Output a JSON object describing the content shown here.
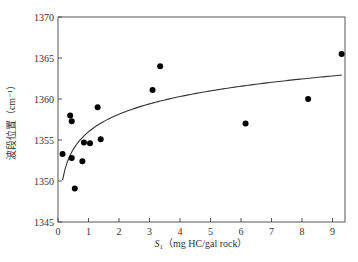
{
  "chart_data": {
    "type": "scatter",
    "title": "",
    "xlabel": "S1（mg HC/gal rock）",
    "xlabel_main": "S",
    "xlabel_sub": "1",
    "xlabel_rest": "（mg HC/gal rock）",
    "ylabel": "波段位置（cm⁻¹）",
    "xlim": [
      0,
      9.4
    ],
    "ylim": [
      1345,
      1370
    ],
    "xticks": [
      0,
      1,
      2,
      3,
      4,
      5,
      6,
      7,
      8,
      9
    ],
    "yticks": [
      1345,
      1350,
      1355,
      1360,
      1365,
      1370
    ],
    "grid": false,
    "legend": null,
    "series": [
      {
        "name": "samples",
        "kind": "scatter",
        "points": [
          {
            "x": 0.15,
            "y": 1353.3
          },
          {
            "x": 0.4,
            "y": 1358.0
          },
          {
            "x": 0.45,
            "y": 1357.3
          },
          {
            "x": 0.45,
            "y": 1352.8
          },
          {
            "x": 0.55,
            "y": 1349.1
          },
          {
            "x": 0.8,
            "y": 1352.4
          },
          {
            "x": 0.85,
            "y": 1354.7
          },
          {
            "x": 1.05,
            "y": 1354.6
          },
          {
            "x": 1.3,
            "y": 1359.0
          },
          {
            "x": 1.4,
            "y": 1355.1
          },
          {
            "x": 3.1,
            "y": 1361.1
          },
          {
            "x": 3.35,
            "y": 1364.0
          },
          {
            "x": 6.15,
            "y": 1357.0
          },
          {
            "x": 8.2,
            "y": 1360.0
          },
          {
            "x": 9.3,
            "y": 1365.5
          }
        ]
      },
      {
        "name": "log fit",
        "kind": "line",
        "equation": "y = 1356.0 + 3.1·ln(x)",
        "x_range": [
          0.15,
          9.3
        ]
      }
    ]
  }
}
